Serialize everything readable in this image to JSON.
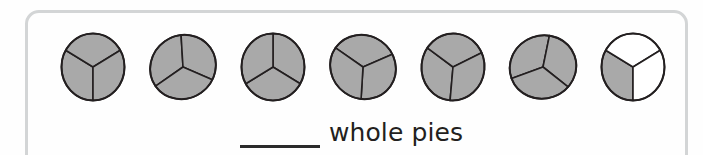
{
  "worksheet": {
    "panel": {
      "border_color": "#d3d5d6"
    },
    "pies": {
      "count": 7,
      "slices_per_pie": 3,
      "shaded_color": "#a9a9a9",
      "unshaded_color": "#ffffff",
      "outline_color": "#231f20",
      "total_shaded_thirds": 19,
      "whole_pies_shaded": 6,
      "items": [
        {
          "index": 1,
          "name": "pie-1",
          "shaded_slices": 3,
          "rotation_deg": 0,
          "slices": [
            {
              "shaded": true
            },
            {
              "shaded": true
            },
            {
              "shaded": true
            }
          ]
        },
        {
          "index": 2,
          "name": "pie-2",
          "shaded_slices": 3,
          "rotation_deg": 55,
          "slices": [
            {
              "shaded": true
            },
            {
              "shaded": true
            },
            {
              "shaded": true
            }
          ]
        },
        {
          "index": 3,
          "name": "pie-3",
          "shaded_slices": 3,
          "rotation_deg": 180,
          "slices": [
            {
              "shaded": true
            },
            {
              "shaded": true
            },
            {
              "shaded": true
            }
          ]
        },
        {
          "index": 4,
          "name": "pie-4",
          "shaded_slices": 3,
          "rotation_deg": 125,
          "slices": [
            {
              "shaded": true
            },
            {
              "shaded": true
            },
            {
              "shaded": true
            }
          ]
        },
        {
          "index": 5,
          "name": "pie-5",
          "shaded_slices": 3,
          "rotation_deg": 5,
          "slices": [
            {
              "shaded": true
            },
            {
              "shaded": true
            },
            {
              "shaded": true
            }
          ]
        },
        {
          "index": 6,
          "name": "pie-6",
          "shaded_slices": 3,
          "rotation_deg": 70,
          "slices": [
            {
              "shaded": true
            },
            {
              "shaded": true
            },
            {
              "shaded": true
            }
          ]
        },
        {
          "index": 7,
          "name": "pie-7",
          "shaded_slices": 1,
          "rotation_deg": 0,
          "slices": [
            {
              "shaded": true
            },
            {
              "shaded": false
            },
            {
              "shaded": false
            }
          ]
        }
      ]
    },
    "answer": {
      "blank_value": "",
      "label": "whole pies"
    }
  }
}
